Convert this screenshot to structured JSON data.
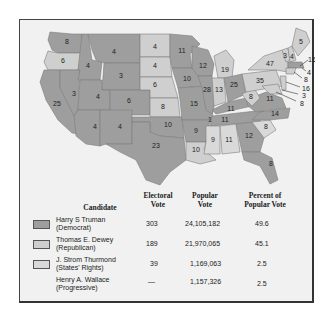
{
  "figure": {
    "colors": {
      "democrat": "#9e9e9e",
      "republican": "#cfcfcf",
      "states_rights": "#d9d9d9",
      "background": "#f1f1f1"
    }
  },
  "map": {
    "state_labels": [
      {
        "state": "WA",
        "ev": "8"
      },
      {
        "state": "OR",
        "ev": "6"
      },
      {
        "state": "CA",
        "ev": "25"
      },
      {
        "state": "ID",
        "ev": "4"
      },
      {
        "state": "NV",
        "ev": "3"
      },
      {
        "state": "MT",
        "ev": "4"
      },
      {
        "state": "WY",
        "ev": "3"
      },
      {
        "state": "UT",
        "ev": "4"
      },
      {
        "state": "CO",
        "ev": "6"
      },
      {
        "state": "AZ",
        "ev": "4"
      },
      {
        "state": "NM",
        "ev": "4"
      },
      {
        "state": "ND",
        "ev": "4"
      },
      {
        "state": "SD",
        "ev": "4"
      },
      {
        "state": "NE",
        "ev": "6"
      },
      {
        "state": "KS",
        "ev": "8"
      },
      {
        "state": "OK",
        "ev": "10"
      },
      {
        "state": "TX",
        "ev": "23"
      },
      {
        "state": "MN",
        "ev": "11"
      },
      {
        "state": "IA",
        "ev": "10"
      },
      {
        "state": "MO",
        "ev": "15"
      },
      {
        "state": "AR",
        "ev": "9"
      },
      {
        "state": "LA",
        "ev": "10"
      },
      {
        "state": "WI",
        "ev": "12"
      },
      {
        "state": "IL",
        "ev": "28"
      },
      {
        "state": "MI",
        "ev": "19"
      },
      {
        "state": "IN",
        "ev": "13"
      },
      {
        "state": "OH",
        "ev": "25"
      },
      {
        "state": "KY",
        "ev": "11"
      },
      {
        "state": "TN",
        "ev": "11"
      },
      {
        "state": "TN_split",
        "ev": "1"
      },
      {
        "state": "MS",
        "ev": "9"
      },
      {
        "state": "AL",
        "ev": "11"
      },
      {
        "state": "GA",
        "ev": "12"
      },
      {
        "state": "FL",
        "ev": "8"
      },
      {
        "state": "SC",
        "ev": "8"
      },
      {
        "state": "NC",
        "ev": "14"
      },
      {
        "state": "VA",
        "ev": "11"
      },
      {
        "state": "WV",
        "ev": "8"
      },
      {
        "state": "PA",
        "ev": "35"
      },
      {
        "state": "NY",
        "ev": "47"
      },
      {
        "state": "VT",
        "ev": "3"
      },
      {
        "state": "NH",
        "ev": "4"
      },
      {
        "state": "ME",
        "ev": "5"
      }
    ],
    "callouts": [
      {
        "state": "MA",
        "ev": "16"
      },
      {
        "state": "RI",
        "ev": "4"
      },
      {
        "state": "CT",
        "ev": "8"
      },
      {
        "state": "NJ",
        "ev": "16"
      },
      {
        "state": "DE",
        "ev": "3"
      },
      {
        "state": "MD",
        "ev": "8"
      }
    ]
  },
  "table": {
    "headers": {
      "candidate": "Candidate",
      "electoral_1": "Electoral",
      "electoral_2": "Vote",
      "popular_1": "Popular",
      "popular_2": "Vote",
      "percent_1": "Percent of",
      "percent_2": "Popular Vote"
    },
    "rows": [
      {
        "name": "Harry S Truman",
        "party": "(Democrat)",
        "electoral": "303",
        "popular": "24,105,182",
        "percent": "49.6",
        "swatch": "#9e9e9e"
      },
      {
        "name": "Thomas E. Dewey",
        "party": "(Republican)",
        "electoral": "189",
        "popular": "21,970,065",
        "percent": "45.1",
        "swatch": "#cfcfcf"
      },
      {
        "name": "J. Strom Thurmond",
        "party": "(States' Rights)",
        "electoral": "39",
        "popular": "1,169,063",
        "percent": "2.5",
        "swatch": "#d9d9d9"
      },
      {
        "name": "Henry A. Wallace",
        "party": "(Progressive)",
        "electoral": "—",
        "popular": "1,157,326",
        "percent": "2.5",
        "swatch": ""
      }
    ]
  }
}
